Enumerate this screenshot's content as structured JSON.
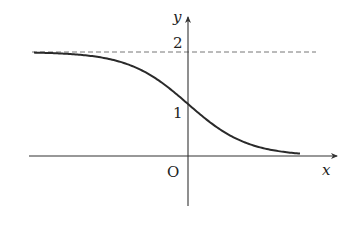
{
  "chart_data": {
    "type": "line",
    "title": "",
    "xlabel": "x",
    "ylabel": "y",
    "origin_label": "O",
    "y_ticks": [
      {
        "value": 1,
        "label": "1"
      },
      {
        "value": 2,
        "label": "2"
      }
    ],
    "asymptote": {
      "y": 2,
      "style": "dashed"
    },
    "function_description": "decreasing S-shaped curve approaching y=2 as x→-∞ and y=0 as x→+∞, passing through (0,1)",
    "series": [
      {
        "name": "curve",
        "x": [
          -5,
          -4,
          -3,
          -2.5,
          -2,
          -1.5,
          -1,
          -0.5,
          0,
          0.5,
          1,
          1.5,
          2,
          2.5,
          3,
          3.5
        ],
        "y": [
          1.987,
          1.964,
          1.905,
          1.848,
          1.762,
          1.635,
          1.462,
          1.245,
          1.0,
          0.755,
          0.538,
          0.365,
          0.238,
          0.152,
          0.095,
          0.059
        ]
      }
    ],
    "xlim": [
      -5.3,
      4.5
    ],
    "ylim": [
      -1.3,
      2.8
    ],
    "grid": false,
    "legend": "none"
  },
  "layout": {
    "origin_px": [
      188,
      156
    ],
    "px_per_unit_x": 30,
    "px_per_unit_y": 52,
    "curve_color": "#2a2a2a",
    "axis_color": "#333333",
    "dash_color": "#777777"
  }
}
